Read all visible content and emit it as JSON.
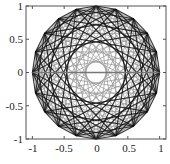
{
  "chart_data": {
    "type": "line",
    "title": "",
    "xlabel": "",
    "ylabel": "",
    "xlim": [
      -1.1,
      1.1
    ],
    "ylim": [
      -1,
      1
    ],
    "grid": false,
    "legend": null,
    "aspect": "equal",
    "x_ticks": [
      -1,
      -0.5,
      0,
      0.5,
      1
    ],
    "x_tick_labels": [
      "-1",
      "-0.5",
      "0",
      "0.5",
      "1"
    ],
    "y_ticks": [
      1,
      0.5,
      0,
      -0.5,
      -1
    ],
    "y_tick_labels": [
      "1",
      "0.5",
      "0",
      "-0.5",
      "-1"
    ],
    "circle": {
      "n_points": 20,
      "radius": 1.0,
      "start_angle_deg": 0
    },
    "series": [
      {
        "name": "light chords",
        "color": "#9a9a9a",
        "width": 0.9,
        "skips": [
          2,
          4,
          6,
          8,
          9
        ]
      },
      {
        "name": "dark chords",
        "color": "#111111",
        "width": 1.1,
        "skips": [
          1,
          3,
          5,
          7
        ]
      }
    ],
    "diameter": {
      "from": [
        -1,
        0
      ],
      "to": [
        1,
        0
      ],
      "color": "#777777"
    }
  },
  "caption": ""
}
